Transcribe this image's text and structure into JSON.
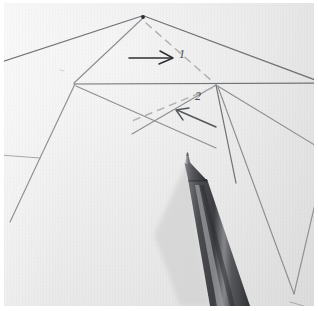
{
  "scene": {
    "kind": "photograph",
    "subject": "folded paper crease pattern with ballpoint pen",
    "paper_color": "#eeeeee",
    "frame_color": "#ffffff",
    "crease_line_color": "#8d8f93",
    "dashed_line_color": "#b3b2ae",
    "annotation_color": "#2f3033",
    "pen_body_color": "#4a4b4f",
    "pen_tip_color": "#8e8f92"
  },
  "annotations": {
    "labels": [
      {
        "id": "label-1",
        "text": "1",
        "x": 176,
        "y": 50
      },
      {
        "id": "label-2",
        "text": "2",
        "x": 192,
        "y": 93
      }
    ],
    "arrows": [
      {
        "id": "arrow-1",
        "direction": "right",
        "from_x": 129,
        "from_y": 58,
        "to_x": 173,
        "to_y": 58
      },
      {
        "id": "arrow-2",
        "direction": "left",
        "from_x": 214,
        "from_y": 125,
        "to_x": 176,
        "to_y": 110
      }
    ]
  },
  "geometry": {
    "apex_vertex": {
      "x": 142,
      "y": 16
    },
    "left_vertex": {
      "x": 71,
      "y": 81
    },
    "right_vertex": {
      "x": 212,
      "y": 82
    },
    "lower_left_vertex": {
      "x": 36,
      "y": 155
    },
    "lower_right_vertex": {
      "x": 290,
      "y": 291
    }
  },
  "pen": {
    "tip": {
      "x": 185,
      "y": 159
    },
    "angle_degrees": 19,
    "visible_length": 150
  }
}
